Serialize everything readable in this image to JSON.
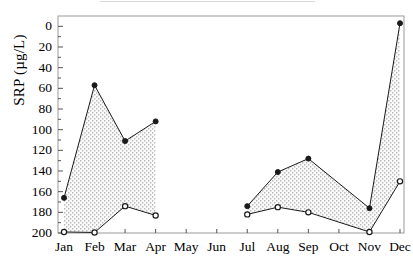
{
  "axes": {
    "ylabel": "SRP (µg/L)",
    "ytick_labels": [
      "200",
      "180",
      "160",
      "140",
      "120",
      "100",
      "80",
      "60",
      "40",
      "20",
      "0"
    ],
    "xtick_labels": [
      "Jan",
      "Feb",
      "Mar",
      "Apr",
      "May",
      "Jun",
      "Jul",
      "Aug",
      "Sep",
      "Oct",
      "Nov",
      "Dec"
    ]
  },
  "style": {
    "line_color": "#1a1a1a",
    "fill_color": "#f2f2f2",
    "stipple_color": "#7a7a7a",
    "axis_color": "#555555",
    "frame_color": "#9a9a9a",
    "background": "#ffffff"
  },
  "chart_data": {
    "type": "area",
    "title": "",
    "xlabel": "",
    "ylabel": "SRP (µg/L)",
    "categories": [
      "Jan",
      "Feb",
      "Mar",
      "Apr",
      "May",
      "Jun",
      "Jul",
      "Aug",
      "Sep",
      "Oct",
      "Nov",
      "Dec"
    ],
    "ylim": [
      0,
      210
    ],
    "ytick_step": 20,
    "yticks": [
      0,
      20,
      40,
      60,
      80,
      100,
      120,
      140,
      160,
      180,
      200
    ],
    "grid": false,
    "legend": "none",
    "series": [
      {
        "name": "upper",
        "marker": "filled-circle",
        "values": [
          34,
          143,
          89,
          108,
          null,
          null,
          26,
          59,
          72,
          null,
          24,
          203
        ]
      },
      {
        "name": "lower",
        "marker": "open-circle",
        "values": [
          1,
          0.5,
          26,
          17,
          null,
          null,
          18,
          25,
          20,
          null,
          1,
          50
        ]
      }
    ],
    "segments": [
      {
        "months": [
          "Jan",
          "Feb",
          "Mar",
          "Apr"
        ]
      },
      {
        "months": [
          "Jul",
          "Aug",
          "Sep",
          "Oct",
          "Nov",
          "Dec"
        ]
      }
    ]
  }
}
